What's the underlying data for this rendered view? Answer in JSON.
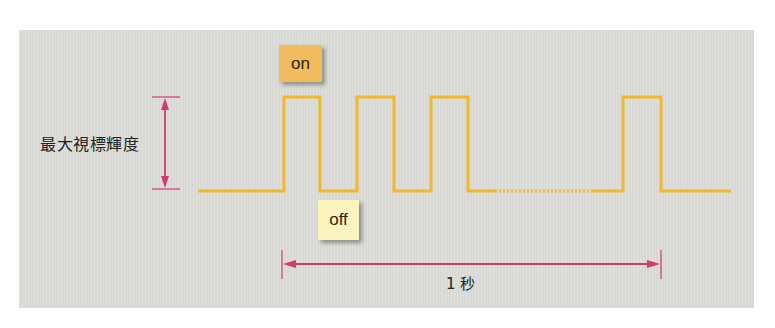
{
  "diagram": {
    "type": "pulse-waveform",
    "labels": {
      "on": "on",
      "off": "off",
      "luminance": "最大視標輝度",
      "duration": "1 秒"
    },
    "colors": {
      "panel_background": "#dcdcd8",
      "waveform": "#f0b82a",
      "arrows": "#d23a72",
      "on_box": "#f2bb5e",
      "off_box": "#fbf4bf"
    },
    "waveform": {
      "segments": [
        {
          "state": "off",
          "style": "solid"
        },
        {
          "state": "on",
          "style": "solid"
        },
        {
          "state": "off",
          "style": "solid"
        },
        {
          "state": "on",
          "style": "solid"
        },
        {
          "state": "off",
          "style": "solid"
        },
        {
          "state": "on",
          "style": "solid"
        },
        {
          "state": "off",
          "style": "dotted-continuation"
        },
        {
          "state": "on",
          "style": "solid"
        },
        {
          "state": "off",
          "style": "solid"
        }
      ]
    }
  }
}
